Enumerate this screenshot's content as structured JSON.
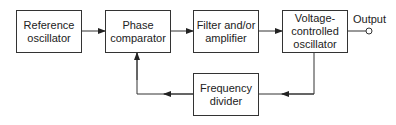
{
  "diagram": {
    "blocks": [
      {
        "id": "ref",
        "label": "Reference\noscillator"
      },
      {
        "id": "phase",
        "label": "Phase\ncomparator"
      },
      {
        "id": "filter",
        "label": "Filter and/or\namplifier"
      },
      {
        "id": "vco",
        "label": "Voltage-\ncontrolled\noscillator"
      },
      {
        "id": "divider",
        "label": "Frequency\ndivider"
      }
    ],
    "output_label": "Output",
    "connections": [
      {
        "from": "ref",
        "to": "phase"
      },
      {
        "from": "phase",
        "to": "filter"
      },
      {
        "from": "filter",
        "to": "vco"
      },
      {
        "from": "vco",
        "to": "output"
      },
      {
        "from": "vco",
        "to": "divider"
      },
      {
        "from": "divider",
        "to": "phase"
      }
    ]
  }
}
